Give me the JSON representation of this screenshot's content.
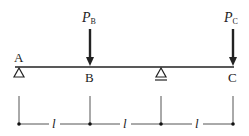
{
  "diagram": {
    "type": "beam",
    "colors": {
      "line": "#222222",
      "dim": "#555555",
      "background": "#ffffff"
    },
    "points": [
      {
        "id": "A",
        "label": "A",
        "support": "pin"
      },
      {
        "id": "B",
        "label": "B",
        "support": "none"
      },
      {
        "id": "D",
        "label": "",
        "support": "roller"
      },
      {
        "id": "C",
        "label": "C",
        "support": "none"
      }
    ],
    "loads": [
      {
        "at": "B",
        "symbol": "P",
        "subscript": "B"
      },
      {
        "at": "C",
        "symbol": "P",
        "subscript": "C"
      }
    ],
    "dimensions": [
      {
        "label": "l"
      },
      {
        "label": "l"
      },
      {
        "label": "l"
      }
    ]
  }
}
